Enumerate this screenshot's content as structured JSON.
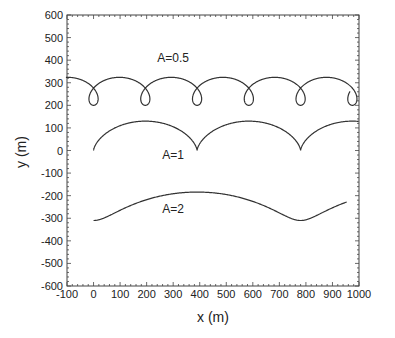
{
  "chart_data": {
    "type": "line",
    "title": "",
    "xlabel": "x (m)",
    "ylabel": "y (m)",
    "xlim": [
      -100,
      1000
    ],
    "ylim": [
      -600,
      600
    ],
    "xticks": [
      -100,
      0,
      100,
      200,
      300,
      400,
      500,
      600,
      700,
      800,
      900,
      1000
    ],
    "yticks": [
      600,
      500,
      400,
      300,
      200,
      100,
      0,
      -100,
      -200,
      -300,
      -400,
      -500,
      -600
    ],
    "grid": false,
    "legend": "none (inline annotations)",
    "line_color": "#333333",
    "series": [
      {
        "name": "A=0.5",
        "description": "looping (prolate trochoid) path, loops at x≈195, 390, 585, 780",
        "label_pos": [
          300,
          410
        ],
        "approx_points": [
          [
            -10,
            205
          ],
          [
            0,
            190
          ],
          [
            60,
            300
          ],
          [
            130,
            320
          ],
          [
            195,
            250
          ],
          [
            195,
            195
          ],
          [
            260,
            320
          ],
          [
            390,
            250
          ],
          [
            390,
            195
          ],
          [
            585,
            250
          ],
          [
            585,
            195
          ],
          [
            780,
            250
          ],
          [
            780,
            195
          ],
          [
            990,
            260
          ]
        ],
        "trochoid": {
          "period": 195,
          "mean_y": 262,
          "radius_y": 62,
          "loop_factor": 1.85,
          "t_start": -0.55,
          "t_end": 5.25
        }
      },
      {
        "name": "A=1",
        "description": "cycloid with cusps at x≈0, 390, 780, peaks ≈130",
        "label_pos": [
          300,
          -20
        ],
        "approx_points": [
          [
            0,
            0
          ],
          [
            195,
            130
          ],
          [
            390,
            0
          ],
          [
            585,
            130
          ],
          [
            780,
            0
          ],
          [
            1000,
            130
          ]
        ],
        "trochoid": {
          "period": 390,
          "mean_y": 65,
          "radius_y": 65,
          "loop_factor": 1.0,
          "t_start": 0,
          "t_end": 2.57
        }
      },
      {
        "name": "A=2",
        "description": "smooth wave, min ≈-310 at x≈0 and 780, max ≈-185 at x≈390",
        "label_pos": [
          300,
          -260
        ],
        "approx_points": [
          [
            0,
            -310
          ],
          [
            100,
            -280
          ],
          [
            200,
            -220
          ],
          [
            390,
            -185
          ],
          [
            600,
            -230
          ],
          [
            780,
            -310
          ],
          [
            1000,
            -205
          ]
        ],
        "trochoid": {
          "period": 780,
          "mean_y": -247,
          "radius_y": 63,
          "loop_factor": 0.5,
          "t_start": 0,
          "t_end": 1.3
        }
      }
    ]
  }
}
